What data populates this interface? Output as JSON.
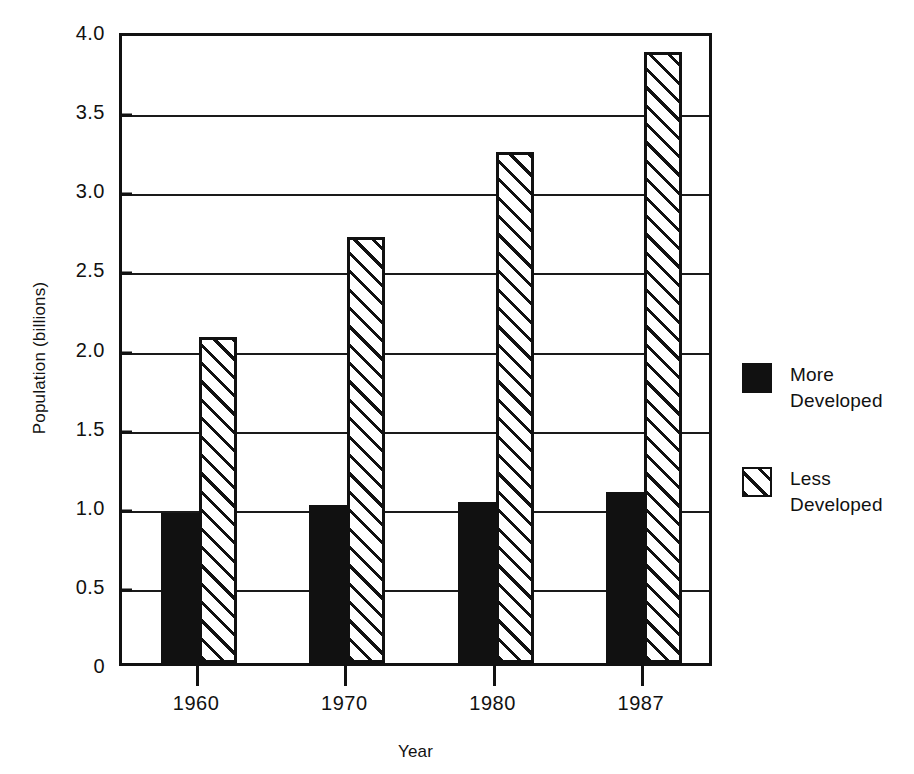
{
  "chart_data": {
    "type": "bar",
    "title": "",
    "xlabel": "Year",
    "ylabel": "Population (billions)",
    "categories": [
      "1960",
      "1970",
      "1980",
      "1987"
    ],
    "series": [
      {
        "name": "More Developed",
        "values": [
          0.95,
          1.0,
          1.02,
          1.08
        ],
        "fill": "solid-black"
      },
      {
        "name": "Less Developed",
        "values": [
          2.06,
          2.69,
          3.23,
          3.86
        ],
        "fill": "diagonal-hatch"
      }
    ],
    "ylim": [
      0,
      4.0
    ],
    "ytick_labels": [
      "0",
      "0.5",
      "1.0",
      "1.5",
      "2.0",
      "2.5",
      "3.0",
      "3.5",
      "4.0"
    ],
    "ytick_values": [
      0,
      0.5,
      1.0,
      1.5,
      2.0,
      2.5,
      3.0,
      3.5,
      4.0
    ],
    "grid": true,
    "legend_position": "right",
    "legend": [
      {
        "label_line1": "More",
        "label_line2": "Developed"
      },
      {
        "label_line1": "Less",
        "label_line2": "Developed"
      }
    ]
  },
  "colors": {
    "ink": "#111111",
    "paper": "#ffffff"
  }
}
